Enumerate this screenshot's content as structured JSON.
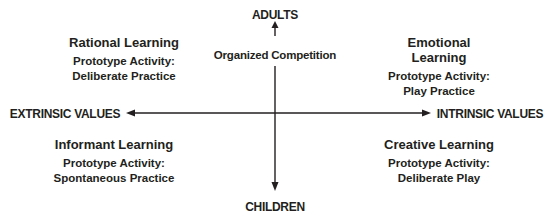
{
  "axes": {
    "top": "ADULTS",
    "bottom": "CHILDREN",
    "left": "EXTRINSIC VALUES",
    "right": "INTRINSIC VALUES",
    "center_label": "Organized Competition"
  },
  "quadrants": [
    {
      "position": "top-left",
      "title": "Rational Learning",
      "line1": "Prototype Activity:",
      "line2": "Deliberate Practice"
    },
    {
      "position": "top-right",
      "title": "Emotional Learning",
      "line1": "Prototype Activity:",
      "line2": "Play Practice"
    },
    {
      "position": "bottom-left",
      "title": "Informant Learning",
      "line1": "Prototype Activity:",
      "line2": "Spontaneous Practice"
    },
    {
      "position": "bottom-right",
      "title": "Creative Learning",
      "line1": "Prototype Activity:",
      "line2": "Deliberate Play"
    }
  ],
  "colors": {
    "ink": "#231f20",
    "background": "#ffffff"
  }
}
